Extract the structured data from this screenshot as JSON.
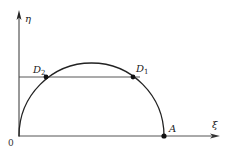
{
  "diagram": {
    "axes": {
      "x_label": "ξ",
      "y_label": "η",
      "origin_label": "0"
    },
    "points": [
      {
        "id": "D2",
        "label": "D",
        "sub": "2",
        "x": 46,
        "y": 77
      },
      {
        "id": "D1",
        "label": "D",
        "sub": "1",
        "x": 133,
        "y": 77
      },
      {
        "id": "A",
        "label": "A",
        "sub": "",
        "x": 164,
        "y": 136
      }
    ],
    "curve": {
      "type": "half-ellipse",
      "cx": 91.5,
      "cy": 136,
      "rx": 72.5,
      "ry": 73
    },
    "chord": {
      "x1": 19,
      "x2": 140,
      "y": 77
    },
    "colors": {
      "stroke": "#222222",
      "axis": "#444444",
      "background": "#ffffff"
    }
  }
}
